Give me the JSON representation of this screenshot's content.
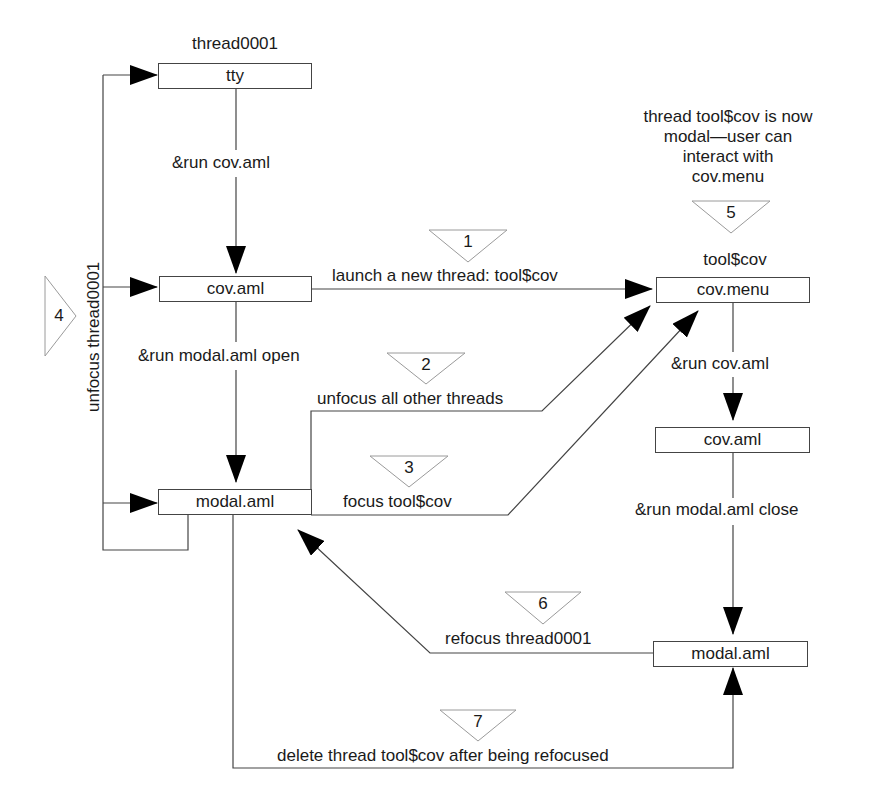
{
  "diagram": {
    "type": "flowchart",
    "threads": {
      "main": "thread0001",
      "tool": "tool$cov"
    },
    "note": {
      "line1": "thread tool$cov is now",
      "line2": "modal—user can",
      "line3": "interact with",
      "line4": "cov.menu"
    },
    "nodes": {
      "tty": "tty",
      "cov_aml_left": "cov.aml",
      "modal_aml_left": "modal.aml",
      "cov_menu": "cov.menu",
      "cov_aml_right": "cov.aml",
      "modal_aml_right": "modal.aml"
    },
    "edges": {
      "run_cov_left": "&run cov.aml",
      "run_modal_open": "&run modal.aml open",
      "launch": "launch a new thread: tool$cov",
      "unfocus_others": "unfocus all other threads",
      "focus_tool": "focus tool$cov",
      "unfocus_thread": "unfocus thread0001",
      "run_cov_right": "&run cov.aml",
      "run_modal_close": "&run modal.aml close",
      "refocus": "refocus thread0001",
      "delete": "delete thread tool$cov after being refocused"
    },
    "steps": [
      "1",
      "2",
      "3",
      "4",
      "5",
      "6",
      "7"
    ],
    "colors": {
      "line": "#444444",
      "text": "#1a1a1a",
      "marker_outline": "#9a9a9a"
    }
  }
}
